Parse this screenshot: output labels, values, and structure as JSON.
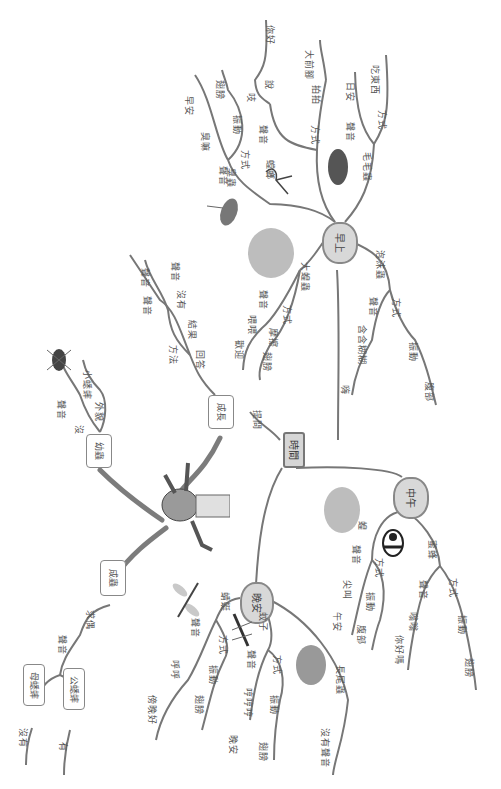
{
  "center": {
    "label": "時間"
  },
  "branches": {
    "morning": {
      "label": "早上",
      "children": {
        "mantis": {
          "label": "螳螂",
          "sound": "聲音",
          "sound_words": [
            "你好",
            "說",
            "吱"
          ],
          "method": "方式",
          "method_words": [
            "拍拍",
            "大前腳"
          ]
        },
        "caterpillar": {
          "label": "毛毛蟲",
          "sound": "聲音",
          "sound_words": [
            "日安"
          ],
          "method": "方式",
          "method_words": [
            "吃東西"
          ]
        },
        "stinkbug": {
          "label": "臭蟲",
          "sound": "聲音",
          "sound_words": [
            "臭嘛",
            "早安"
          ],
          "method": "方式",
          "method_words": [
            "振動",
            "翅膀"
          ]
        },
        "grasshopper": {
          "label": "大蝗蟲",
          "sound": "聲音",
          "sound_words": [
            "喂喂",
            "歡迎"
          ],
          "method": "方式",
          "method_words": [
            "摩擦",
            "翅膀"
          ]
        },
        "froghopper": {
          "label": "泡沫蟲",
          "sound": "聲音",
          "sound_words": [
            "含含糊糊",
            "嗨"
          ],
          "method": "方式",
          "method_words": [
            "振動",
            "腹部"
          ]
        }
      }
    },
    "noon": {
      "label": "中午",
      "children": {
        "locust": {
          "label": "蝗",
          "sound": "聲音",
          "sound_words": [
            "尖叫",
            "午安"
          ],
          "method": "方式",
          "method_words": [
            "振動",
            "腹部"
          ]
        },
        "bee": {
          "label": "蜜蜂",
          "sound": "聲音",
          "sound_words": [
            "嗡嗡",
            "你好嗎"
          ],
          "method": "方式",
          "method_words": [
            "振動",
            "翅膀"
          ]
        }
      }
    },
    "evening": {
      "label": "晚安",
      "children": {
        "dragonfly": {
          "label": "蜻蜓",
          "sound": "聲音",
          "sound_words": [
            "呼呼",
            "傍晚好"
          ],
          "method": "方式",
          "method_words": [
            "振動",
            "翅膀"
          ]
        },
        "mosquito": {
          "label": "蚊子",
          "sound": "聲音",
          "sound_words": [
            "哼哼哼",
            "晚安"
          ],
          "method": "方式",
          "method_words": [
            "振動",
            "翅膀"
          ]
        },
        "mayfly": {
          "label": "長尾蟲",
          "sound_words": [
            "沒有聲音"
          ]
        }
      }
    }
  },
  "growth": {
    "nymph": {
      "label": "幼蟲",
      "path": [
        "沒",
        "外貌",
        "小蟋蟀",
        "聲音"
      ]
    },
    "adult_stage": {
      "label": "成長",
      "path": [
        "回答",
        "方法",
        "結果",
        "沒有",
        "聲音",
        "聲音"
      ]
    },
    "adult": {
      "label": "成蟲",
      "path": [
        "求偶",
        "聲音"
      ],
      "female": "母蟋蟀",
      "female_answer": "沒有",
      "male": "公蟋蟀",
      "male_answer": "有"
    },
    "ask": {
      "path": [
        "提問"
      ]
    }
  },
  "colors": {
    "line": "#777777",
    "node_fill": "#d6d6d6",
    "text": "#555555"
  }
}
